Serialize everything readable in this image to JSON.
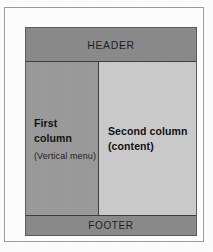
{
  "figure": {
    "kind": "page-layout-diagram",
    "frame_border_color": "#9c9c9c",
    "box_border_color": "#3d3d3d"
  },
  "header": {
    "label": "HEADER",
    "background_color": "#8a8a8a",
    "text_color": "#1c1c1c"
  },
  "first_column": {
    "title_line1": "First",
    "title_line2": "column",
    "subtitle": "(Vertical menu)",
    "background_color": "#9a9a9a",
    "text_color": "#101010"
  },
  "second_column": {
    "title_line1": "Second column",
    "title_line2": "(content)",
    "background_color": "#cbcbcb",
    "text_color": "#101010"
  },
  "footer": {
    "label": "FOOTER",
    "background_color": "#8a8a8a",
    "text_color": "#1c1c1c"
  }
}
